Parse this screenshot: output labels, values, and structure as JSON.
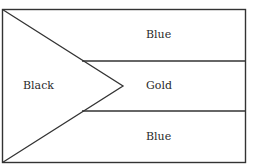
{
  "diagram": {
    "type": "flag-layout",
    "regions": [
      {
        "id": "hoist-triangle",
        "label": "Black"
      },
      {
        "id": "top-band",
        "label": "Blue"
      },
      {
        "id": "middle-band",
        "label": "Gold"
      },
      {
        "id": "bottom-band",
        "label": "Blue"
      }
    ],
    "line_color": "#333333",
    "background": "#ffffff"
  }
}
